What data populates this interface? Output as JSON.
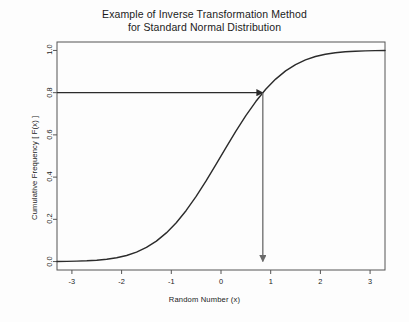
{
  "chart_data": {
    "type": "line",
    "title": "Example of Inverse Transformation Method",
    "subtitle": "for Standard Normal Distribution",
    "xlabel": "Random Number (x)",
    "ylabel": "Cumulative Frequency [ F(x) ]",
    "xlim": [
      -3.3,
      3.3
    ],
    "ylim": [
      -0.04,
      1.04
    ],
    "xticks": [
      -3,
      -2,
      -1,
      0,
      1,
      2,
      3
    ],
    "xtick_labels": [
      "-3",
      "-2",
      "-1",
      "0",
      "1",
      "2",
      "3"
    ],
    "yticks": [
      0.0,
      0.2,
      0.4,
      0.6,
      0.8,
      1.0
    ],
    "ytick_labels": [
      "0.0",
      "0.2",
      "0.4",
      "0.6",
      "0.8",
      "1.0"
    ],
    "grid": false,
    "legend": null,
    "frame": true,
    "series": [
      {
        "name": "Standard Normal CDF",
        "color": "#2b2b2b",
        "linewidth": 1.4,
        "x": [
          -3.3,
          -3.1,
          -2.9,
          -2.7,
          -2.5,
          -2.3,
          -2.1,
          -1.9,
          -1.7,
          -1.5,
          -1.3,
          -1.1,
          -0.9,
          -0.7,
          -0.5,
          -0.3,
          -0.1,
          0.1,
          0.3,
          0.5,
          0.7,
          0.9,
          1.1,
          1.3,
          1.5,
          1.7,
          1.9,
          2.1,
          2.3,
          2.5,
          2.7,
          2.9,
          3.1,
          3.3
        ],
        "y": [
          0.0005,
          0.001,
          0.0019,
          0.0035,
          0.0062,
          0.0107,
          0.0179,
          0.0287,
          0.0446,
          0.0668,
          0.0968,
          0.1357,
          0.1841,
          0.242,
          0.3085,
          0.3821,
          0.4602,
          0.5398,
          0.6179,
          0.6915,
          0.758,
          0.8159,
          0.8643,
          0.9032,
          0.9332,
          0.9554,
          0.9713,
          0.9821,
          0.9893,
          0.9938,
          0.9965,
          0.9981,
          0.999,
          0.9995
        ]
      }
    ],
    "annotations": [
      {
        "name": "horizontal-arrow",
        "kind": "arrow",
        "from": [
          -3.3,
          0.8
        ],
        "to": [
          0.8416,
          0.8
        ],
        "color": "#2b2b2b",
        "label": "F(x) = 0.8"
      },
      {
        "name": "vertical-arrow",
        "kind": "arrow",
        "from": [
          0.8416,
          0.8
        ],
        "to": [
          0.8416,
          0.0
        ],
        "color": "#6a6a6a",
        "label": "x = 0.8416"
      }
    ]
  },
  "colors": {
    "background": "#fdfdfd",
    "axis": "#555555",
    "curve": "#2b2b2b",
    "annotation_horizontal": "#2b2b2b",
    "annotation_vertical": "#6a6a6a",
    "text": "#1b1b1b"
  }
}
